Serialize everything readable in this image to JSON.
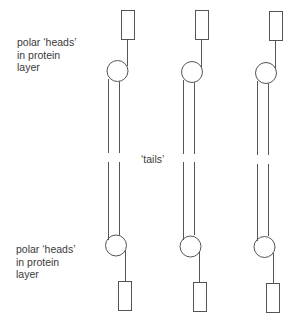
{
  "labels": {
    "top_heads": [
      "polar ‘heads’",
      "in protein",
      "layer"
    ],
    "tails": "‘tails’",
    "bottom_heads": [
      "polar ‘heads’",
      "in protein",
      "layer"
    ]
  },
  "colors": {
    "stroke": "#555555",
    "text": "#3a3a3a",
    "background": "#ffffff"
  },
  "molecule_count": 3
}
